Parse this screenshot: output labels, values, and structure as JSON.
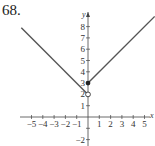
{
  "problem_number": "68.",
  "chart_data": {
    "type": "line",
    "title": "",
    "xlabel": "x",
    "ylabel": "y",
    "xlim": [
      -5.5,
      5.9
    ],
    "ylim": [
      -2.7,
      9
    ],
    "grid": false,
    "x_ticks": [
      -5,
      -4,
      -3,
      -2,
      -1,
      1,
      2,
      3,
      4,
      5
    ],
    "x_tick_labels": [
      "−5",
      "−4",
      "−3",
      "−2",
      "−1",
      "1",
      "2",
      "3",
      "4",
      "5"
    ],
    "y_ticks": [
      -2,
      -1,
      1,
      2,
      3,
      4,
      5,
      6,
      7,
      8
    ],
    "y_tick_labels": [
      "−2",
      "1",
      "2",
      "3",
      "4",
      "5",
      "6",
      "7",
      "8"
    ],
    "series": [
      {
        "name": "left piece: y = -x + 2, x < 0",
        "x": [
          -5.9,
          0
        ],
        "y": [
          7.9,
          2
        ],
        "end_point": {
          "x": 0,
          "y": 2,
          "style": "open"
        }
      },
      {
        "name": "right piece: y = x + 3, x >= 0",
        "x": [
          0,
          5.9
        ],
        "y": [
          3,
          8.9
        ],
        "start_point": {
          "x": 0,
          "y": 3,
          "style": "closed"
        }
      }
    ],
    "annotations": [
      {
        "type": "open-circle",
        "x": 0,
        "y": 2
      },
      {
        "type": "filled-circle",
        "x": 0,
        "y": 3
      }
    ],
    "line_color": "#555555"
  }
}
